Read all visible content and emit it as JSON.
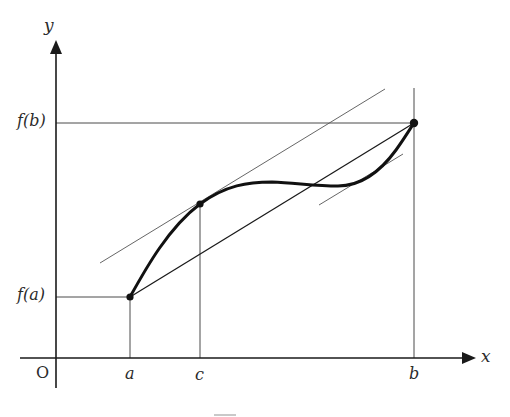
{
  "figure": {
    "background_color": "#ffffff",
    "ink_color": "#111111"
  },
  "axes": {
    "x_axis_label": "x",
    "y_axis_label": "y",
    "origin_label": "O",
    "x_axis_y_pixel": 358,
    "y_axis_x_pixel": 56
  },
  "tick_labels": {
    "a": "a",
    "c": "c",
    "b": "b"
  },
  "value_labels": {
    "f_of_a": "f(a)",
    "f_of_b": "f(b)"
  },
  "chart_data": {
    "type": "line",
    "xlabel": "x",
    "ylabel": "y",
    "grid": false,
    "legend": "none",
    "xlim": [
      56,
      472
    ],
    "ylim": [
      358,
      42
    ],
    "categories": [
      "a",
      "c",
      "b"
    ],
    "points": [
      {
        "name": "(a, f(a))",
        "x_label": "a",
        "y_label": "f(a)",
        "x": 130,
        "y": 297,
        "marker": true
      },
      {
        "name": "(c, f(c))",
        "x_label": "c",
        "y_label": "",
        "x": 200,
        "y": 204,
        "marker": true
      },
      {
        "name": "(b, f(b))",
        "x_label": "b",
        "y_label": "f(b)",
        "x": 414,
        "y": 123,
        "marker": true
      }
    ],
    "series": [
      {
        "name": "f(x)",
        "style": "thick-curve",
        "path": "M 130,297 C 145,270 168,228 200,204 C 226,185 248,182 272,182 C 296,183 316,186 338,186 C 360,186 380,172 396,150 C 404,139 410,129 414,123"
      },
      {
        "name": "secant through (a, f(a)) and (b, f(b))",
        "style": "thin-straight",
        "x1": 130,
        "y1": 297,
        "x2": 414,
        "y2": 123
      },
      {
        "name": "tangent at c (parallel to secant)",
        "style": "thin-straight",
        "x1": 100,
        "y1": 263,
        "x2": 385,
        "y2": 89
      },
      {
        "name": "tangent at second mean value point",
        "style": "thin-straight",
        "x1": 319,
        "y1": 205,
        "x2": 403,
        "y2": 154
      }
    ],
    "guides": [
      {
        "name": "horizontal guide at f(b)",
        "x1": 56,
        "y1": 123,
        "x2": 414,
        "y2": 123
      },
      {
        "name": "horizontal guide at f(a)",
        "x1": 56,
        "y1": 297,
        "x2": 130,
        "y2": 297
      },
      {
        "name": "vertical guide at a",
        "x1": 130,
        "y1": 297,
        "x2": 130,
        "y2": 358
      },
      {
        "name": "vertical guide at c",
        "x1": 200,
        "y1": 204,
        "x2": 200,
        "y2": 358
      },
      {
        "name": "vertical guide at b",
        "x1": 414,
        "y1": 88,
        "x2": 414,
        "y2": 358
      }
    ]
  }
}
